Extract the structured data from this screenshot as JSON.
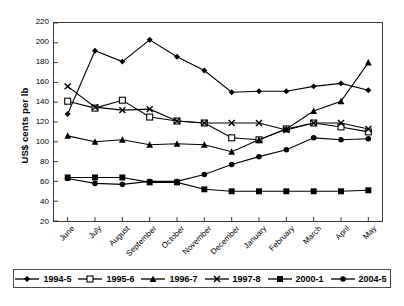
{
  "chart_data": {
    "type": "line",
    "title": "",
    "xlabel": "",
    "ylabel": "US$ cents per lb",
    "ylim": [
      20,
      220
    ],
    "ytick_step": 20,
    "yticks": [
      220,
      200,
      180,
      160,
      140,
      120,
      100,
      80,
      60,
      40,
      20
    ],
    "grid": false,
    "legend_position": "bottom",
    "categories": [
      "June",
      "July",
      "August",
      "September",
      "October",
      "November",
      "December",
      "January",
      "February",
      "March",
      "April",
      "May"
    ],
    "series": [
      {
        "name": "1994-5",
        "marker": "diamond",
        "values": [
          128,
          192,
          181,
          203,
          186,
          172,
          150,
          151,
          151,
          156,
          159,
          152
        ]
      },
      {
        "name": "1995-6",
        "marker": "open-square",
        "values": [
          141,
          134,
          142,
          125,
          121,
          119,
          104,
          102,
          113,
          119,
          115,
          110
        ]
      },
      {
        "name": "1996-7",
        "marker": "triangle",
        "values": [
          106,
          100,
          102,
          97,
          98,
          97,
          90,
          102,
          113,
          131,
          141,
          180
        ]
      },
      {
        "name": "1997-8",
        "marker": "cross",
        "values": [
          156,
          135,
          132,
          133,
          121,
          119,
          119,
          119,
          112,
          119,
          119,
          113
        ]
      },
      {
        "name": "2000-1",
        "marker": "filled-square",
        "values": [
          64,
          64,
          64,
          59,
          59,
          52,
          50,
          50,
          50,
          50,
          50,
          51
        ]
      },
      {
        "name": "2004-5",
        "marker": "circle",
        "values": [
          63,
          58,
          57,
          60,
          60,
          67,
          77,
          85,
          92,
          104,
          102,
          103
        ]
      }
    ]
  },
  "legend": {
    "items": [
      {
        "label": "1994-5",
        "marker": "diamond"
      },
      {
        "label": "1995-6",
        "marker": "open-square"
      },
      {
        "label": "1996-7",
        "marker": "triangle"
      },
      {
        "label": "1997-8",
        "marker": "cross"
      },
      {
        "label": "2000-1",
        "marker": "filled-square"
      },
      {
        "label": "2004-5",
        "marker": "circle"
      }
    ]
  },
  "colors": {
    "line": "#000000",
    "axis": "#3a3a3a",
    "background": "#ffffff"
  }
}
